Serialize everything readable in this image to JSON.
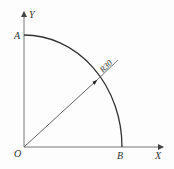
{
  "diagram": {
    "type": "geometry",
    "axes": {
      "x_label": "X",
      "y_label": "Y",
      "origin_label": "O"
    },
    "points": {
      "A": "A",
      "B": "B"
    },
    "dimension": {
      "radius_label": "R30"
    },
    "colors": {
      "line": "#333333",
      "axis": "#777777",
      "background": "#fdfdfd"
    }
  }
}
